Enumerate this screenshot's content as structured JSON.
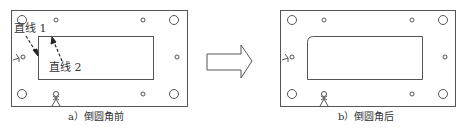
{
  "figure": {
    "panels": [
      {
        "id": "a",
        "caption": "a）倒圆角前",
        "annotations": [
          {
            "text": "直线 1"
          },
          {
            "text": "直线 2"
          }
        ],
        "inner_corner_radius": 0
      },
      {
        "id": "b",
        "caption": "b）倒圆角后",
        "annotations": [],
        "inner_corner_radius": 6
      }
    ],
    "transition_arrow": "right-arrow-icon",
    "colors": {
      "stroke": "#555555",
      "text": "#333333",
      "background": "#ffffff"
    }
  }
}
